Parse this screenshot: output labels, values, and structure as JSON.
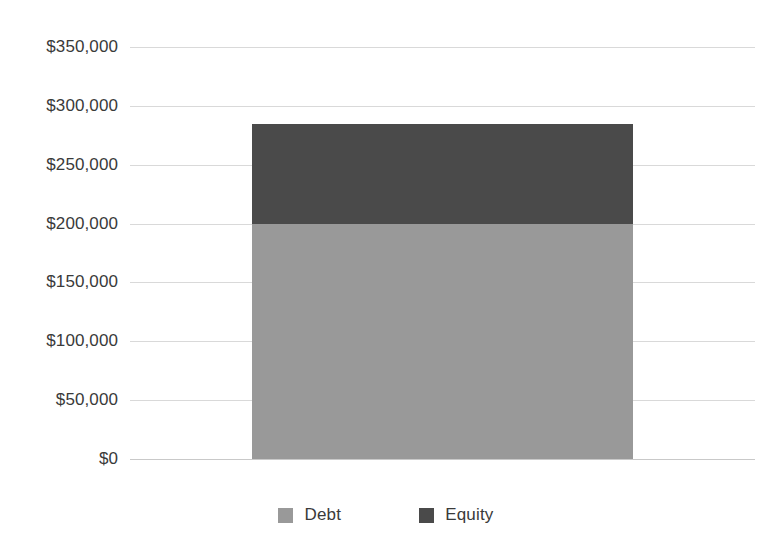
{
  "chart_data": {
    "type": "bar",
    "subtype": "stacked-column",
    "title": "",
    "title_visible": false,
    "title_note": "cropped off the top edge of the screenshot",
    "xlabel": "",
    "ylabel": "",
    "categories": [
      "Capital Structure"
    ],
    "series": [
      {
        "name": "Debt",
        "values": [
          200000
        ],
        "color": "#999999"
      },
      {
        "name": "Equity",
        "values": [
          85000
        ],
        "color": "#4a4a4a"
      }
    ],
    "total": 285000,
    "ylim": [
      0,
      350000
    ],
    "ytick_values": [
      0,
      50000,
      100000,
      150000,
      200000,
      250000,
      300000,
      350000
    ],
    "ytick_labels": [
      "$0",
      "$50,000",
      "$100,000",
      "$150,000",
      "$200,000",
      "$250,000",
      "$300,000",
      "$350,000"
    ],
    "grid": true,
    "grid_axis": "y",
    "grid_color": "#d9d9d9",
    "legend": true,
    "legend_position": "bottom-center",
    "xtick_labels": [],
    "background": "#ffffff"
  },
  "axis": {
    "y_labels": [
      {
        "text": "$350,000",
        "value": 350000
      },
      {
        "text": "$300,000",
        "value": 300000
      },
      {
        "text": "$250,000",
        "value": 250000
      },
      {
        "text": "$200,000",
        "value": 200000
      },
      {
        "text": "$150,000",
        "value": 150000
      },
      {
        "text": "$100,000",
        "value": 100000
      },
      {
        "text": "$50,000",
        "value": 50000
      },
      {
        "text": "$0",
        "value": 0
      }
    ]
  },
  "legend": {
    "items": [
      {
        "label": "Debt",
        "color": "#999999"
      },
      {
        "label": "Equity",
        "color": "#4a4a4a"
      }
    ]
  },
  "colors": {
    "debt": "#999999",
    "equity": "#4a4a4a",
    "gridline": "#d9d9d9",
    "baseline": "#c9c9c9",
    "text": "#3a3a3a",
    "background": "#ffffff"
  }
}
